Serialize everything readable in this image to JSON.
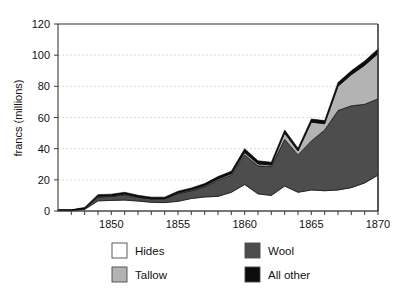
{
  "chart_data": {
    "type": "area",
    "stacked": true,
    "title": "",
    "xlabel": "",
    "ylabel": "francs (millions)",
    "xlim": [
      1846,
      1870
    ],
    "ylim": [
      0,
      120
    ],
    "grid": true,
    "legend_position": "bottom",
    "ytick_labels": [
      "0",
      "20",
      "40",
      "60",
      "80",
      "100",
      "120"
    ],
    "yticks": [
      0,
      20,
      40,
      60,
      80,
      100,
      120
    ],
    "xtick_labels": [
      "1850",
      "1855",
      "1860",
      "1865",
      "1870"
    ],
    "xticks": [
      1850,
      1855,
      1860,
      1865,
      1870
    ],
    "x": [
      1846,
      1847,
      1848,
      1849,
      1850,
      1851,
      1852,
      1853,
      1854,
      1855,
      1856,
      1857,
      1858,
      1859,
      1860,
      1861,
      1862,
      1863,
      1864,
      1865,
      1866,
      1867,
      1868,
      1869,
      1870
    ],
    "series": [
      {
        "name": "Hides",
        "color": "#ffffff",
        "values": [
          0.3,
          0.3,
          1.0,
          6.5,
          6.8,
          7.0,
          6.4,
          5.6,
          5.4,
          6.2,
          8.0,
          9.0,
          9.4,
          12.0,
          17.0,
          11.0,
          10.0,
          16.0,
          12.0,
          13.5,
          13.0,
          13.5,
          15.0,
          18.0,
          23.0
        ]
      },
      {
        "name": "Wool",
        "color": "#4d4d4d",
        "values": [
          0.2,
          0.2,
          0.6,
          2.5,
          2.6,
          3.5,
          2.4,
          2.2,
          2.4,
          5.0,
          5.0,
          6.5,
          10.4,
          11.0,
          19.0,
          18.0,
          18.5,
          30.0,
          24.0,
          31.5,
          39.0,
          51.0,
          52.5,
          50.5,
          49.0
        ]
      },
      {
        "name": "Tallow",
        "color": "#b3b3b3",
        "values": [
          0.1,
          0.1,
          0.2,
          0.5,
          0.4,
          0.4,
          0.4,
          0.3,
          0.3,
          0.5,
          0.6,
          0.7,
          0.8,
          0.9,
          1.5,
          1.2,
          1.0,
          4.0,
          2.5,
          12.0,
          4.0,
          15.5,
          20.0,
          25.0,
          29.0
        ]
      },
      {
        "name": "All other",
        "color": "#0d0d0d",
        "values": [
          0.2,
          0.2,
          0.5,
          1.0,
          1.0,
          1.1,
          0.9,
          0.8,
          0.8,
          1.0,
          1.2,
          1.4,
          1.5,
          1.6,
          2.5,
          2.0,
          1.8,
          2.0,
          1.8,
          2.0,
          2.0,
          2.5,
          2.5,
          2.8,
          3.0
        ]
      }
    ]
  },
  "legend": {
    "entries": [
      {
        "label": "Hides",
        "color": "#ffffff"
      },
      {
        "label": "Wool",
        "color": "#4d4d4d"
      },
      {
        "label": "Tallow",
        "color": "#b3b3b3"
      },
      {
        "label": "All other",
        "color": "#0d0d0d"
      }
    ]
  },
  "axis": {
    "y_title": "francs (millions)"
  }
}
